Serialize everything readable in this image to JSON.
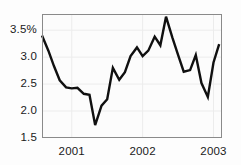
{
  "chart_data": {
    "type": "line",
    "title": "",
    "subtitle": "",
    "xlabel": "",
    "ylabel": "",
    "unit": "%",
    "grid": true,
    "legend": null,
    "legend_position": "none",
    "xlim": [
      2000.58,
      2003.12
    ],
    "ylim": [
      1.5,
      3.8
    ],
    "ytick_labels": [
      "3.5%",
      "3.0",
      "2.5",
      "2.0",
      "1.5"
    ],
    "ytick_values": [
      3.5,
      3.0,
      2.5,
      2.0,
      1.5
    ],
    "xtick_labels": [
      "2001",
      "2002",
      "2003"
    ],
    "xtick_values": [
      2001,
      2002,
      2003
    ],
    "series": [
      {
        "name": "rate",
        "color": "#101010",
        "x": [
          2000.58,
          2000.67,
          2000.75,
          2000.83,
          2000.92,
          2001.0,
          2001.08,
          2001.17,
          2001.25,
          2001.33,
          2001.42,
          2001.5,
          2001.58,
          2001.67,
          2001.75,
          2001.83,
          2001.92,
          2002.0,
          2002.08,
          2002.17,
          2002.25,
          2002.33,
          2002.42,
          2002.5,
          2002.58,
          2002.67,
          2002.75,
          2002.83,
          2002.92,
          2003.0,
          2003.08
        ],
        "y": [
          3.4,
          3.12,
          2.83,
          2.57,
          2.44,
          2.42,
          2.43,
          2.32,
          2.3,
          1.74,
          2.1,
          2.22,
          2.8,
          2.58,
          2.72,
          3.02,
          3.18,
          3.02,
          3.12,
          3.38,
          3.22,
          3.75,
          3.36,
          3.04,
          2.73,
          2.76,
          3.04,
          2.52,
          2.26,
          2.9,
          3.24
        ]
      }
    ],
    "annotations": {
      "minimum": {
        "x": 2001.33,
        "y": 1.74
      },
      "maximum": {
        "x": 2002.33,
        "y": 3.75
      },
      "start": {
        "x": 2000.58,
        "y": 3.4
      },
      "end": {
        "x": 2003.08,
        "y": 3.24
      }
    }
  },
  "axes": {
    "plot_left": 42,
    "plot_right": 222,
    "plot_top": 14,
    "plot_bottom": 138,
    "border_color": "#8a8a8a",
    "grid_color": "#ececec",
    "plot_background": "#fcfcfc"
  }
}
